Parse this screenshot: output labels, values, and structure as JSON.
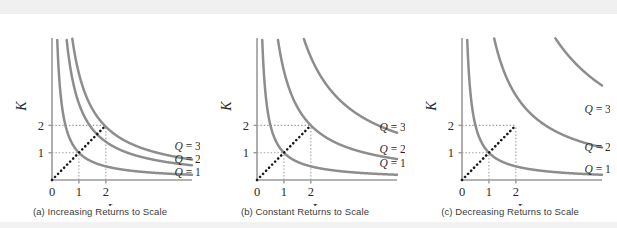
{
  "figure": {
    "axis_color": "#9a9a9a",
    "curve_color": "#8d8d8d",
    "dotted_color": "#1a1a1a",
    "guide_color": "#9a9a9a",
    "background": "#ffffff"
  },
  "chart_data": {
    "type": "line",
    "title": "Returns to Scale",
    "panels": [
      {
        "id": "a",
        "caption": "(a) Increasing Returns to Scale",
        "xlabel": "L",
        "ylabel": "K",
        "xlim": [
          0,
          5.2
        ],
        "ylim": [
          0,
          5.2
        ],
        "xticks": [
          0,
          1,
          2
        ],
        "xtick_labels": [
          "0",
          "1",
          "2"
        ],
        "yticks": [
          1,
          2
        ],
        "ytick_labels": [
          "1",
          "2"
        ],
        "grid": false,
        "legend_position": "right",
        "ray_points": [
          [
            0,
            0
          ],
          [
            1,
            1
          ],
          [
            2,
            2
          ]
        ],
        "guides": [
          {
            "from": [
              0,
              1
            ],
            "to": [
              1,
              1
            ]
          },
          {
            "from": [
              1,
              0
            ],
            "to": [
              1,
              1
            ]
          },
          {
            "from": [
              0,
              2
            ],
            "to": [
              2,
              2
            ]
          },
          {
            "from": [
              2,
              0
            ],
            "to": [
              2,
              2
            ]
          }
        ],
        "series": [
          {
            "name": "Q = 1",
            "label": "Q = 1",
            "constant": 1.0,
            "label_xy": [
              4.55,
              0.3
            ]
          },
          {
            "name": "Q = 2",
            "label": "Q = 2",
            "constant": 2.8,
            "label_xy": [
              4.55,
              0.78
            ]
          },
          {
            "name": "Q = 3",
            "label": "Q = 3",
            "constant": 3.9,
            "label_xy": [
              4.55,
              1.24
            ]
          }
        ]
      },
      {
        "id": "b",
        "caption": "(b) Constant Returns to Scale",
        "xlabel": "L",
        "ylabel": "K",
        "xlim": [
          0,
          5.2
        ],
        "ylim": [
          0,
          5.2
        ],
        "xticks": [
          0,
          1,
          2
        ],
        "xtick_labels": [
          "0",
          "1",
          "2"
        ],
        "yticks": [
          1,
          2
        ],
        "ytick_labels": [
          "1",
          "2"
        ],
        "grid": false,
        "legend_position": "right",
        "ray_points": [
          [
            0,
            0
          ],
          [
            1,
            1
          ],
          [
            2,
            2
          ]
        ],
        "guides": [
          {
            "from": [
              0,
              1
            ],
            "to": [
              1,
              1
            ]
          },
          {
            "from": [
              1,
              0
            ],
            "to": [
              1,
              1
            ]
          },
          {
            "from": [
              0,
              2
            ],
            "to": [
              2,
              2
            ]
          },
          {
            "from": [
              2,
              0
            ],
            "to": [
              2,
              2
            ]
          }
        ],
        "series": [
          {
            "name": "Q = 1",
            "label": "Q = 1",
            "constant": 1.0,
            "label_xy": [
              4.55,
              0.62
            ]
          },
          {
            "name": "Q = 2",
            "label": "Q = 2",
            "constant": 4.0,
            "label_xy": [
              4.55,
              1.14
            ]
          },
          {
            "name": "Q = 3",
            "label": "Q = 3",
            "constant": 9.0,
            "label_xy": [
              4.55,
              1.95
            ]
          }
        ]
      },
      {
        "id": "c",
        "caption": "(c) Decreasing Returns to Scale",
        "xlabel": "L",
        "ylabel": "K",
        "xlim": [
          0,
          5.2
        ],
        "ylim": [
          0,
          5.2
        ],
        "xticks": [
          0,
          1,
          2
        ],
        "xtick_labels": [
          "0",
          "1",
          "2"
        ],
        "yticks": [
          1,
          2
        ],
        "ytick_labels": [
          "1",
          "2"
        ],
        "grid": false,
        "legend_position": "right",
        "ray_points": [
          [
            0,
            0
          ],
          [
            1,
            1
          ],
          [
            2,
            2
          ]
        ],
        "guides": [
          {
            "from": [
              0,
              1
            ],
            "to": [
              1,
              1
            ]
          },
          {
            "from": [
              1,
              0
            ],
            "to": [
              1,
              1
            ]
          },
          {
            "from": [
              0,
              2
            ],
            "to": [
              2,
              2
            ]
          },
          {
            "from": [
              2,
              0
            ],
            "to": [
              2,
              2
            ]
          }
        ],
        "series": [
          {
            "name": "Q = 1",
            "label": "Q = 1",
            "constant": 1.0,
            "label_xy": [
              4.55,
              0.4
            ]
          },
          {
            "name": "Q = 2",
            "label": "Q = 2",
            "constant": 6.2,
            "label_xy": [
              4.55,
              1.22
            ]
          },
          {
            "name": "Q = 3",
            "label": "Q = 3",
            "constant": 18.0,
            "label_xy": [
              4.55,
              2.6
            ]
          }
        ]
      }
    ]
  }
}
